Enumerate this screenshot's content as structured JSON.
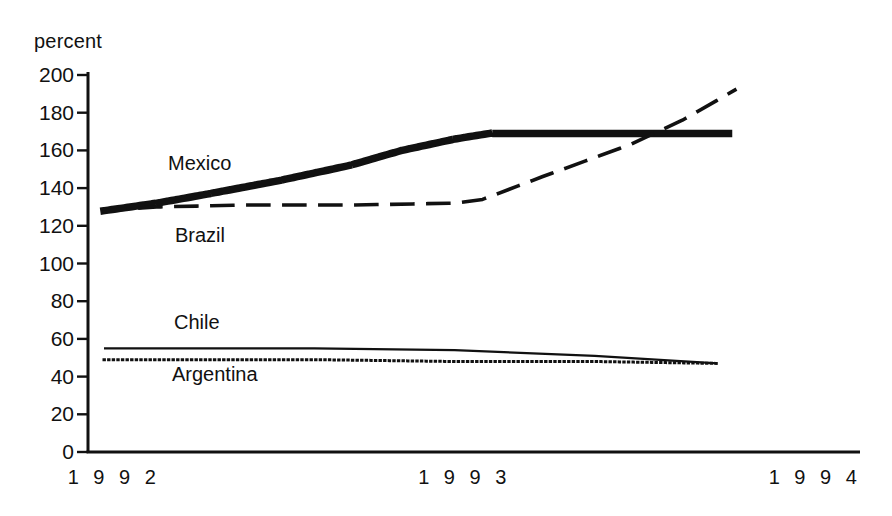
{
  "chart_data": {
    "type": "line",
    "title": "",
    "xlabel": "",
    "ylabel": "percent",
    "ylim": [
      0,
      200
    ],
    "xlim": [
      1992,
      1994
    ],
    "grid": false,
    "legend_position": "inline-labels",
    "ytick_labels": [
      "200",
      "180",
      "160",
      "140",
      "120",
      "100",
      "80",
      "60",
      "40",
      "20",
      "0"
    ],
    "ytick_values": [
      200,
      180,
      160,
      140,
      120,
      100,
      80,
      60,
      40,
      20,
      0
    ],
    "xtick_labels": [
      "1 9 9 2",
      "1 9 9 3",
      "1 9 9 4"
    ],
    "xtick_values": [
      1992,
      1993,
      1994
    ],
    "series": [
      {
        "name": "Mexico",
        "style": "thick-dotted",
        "x": [
          1992.0,
          1992.15,
          1992.3,
          1992.5,
          1992.7,
          1992.85,
          1993.0,
          1993.1,
          1993.2,
          1993.5,
          1993.8
        ],
        "values": [
          128,
          132,
          137,
          144,
          152,
          160,
          166,
          169,
          169,
          169,
          169
        ]
      },
      {
        "name": "Brazil",
        "style": "dashed",
        "x": [
          1992.0,
          1992.15,
          1992.4,
          1992.7,
          1993.0,
          1993.08,
          1993.25,
          1993.5,
          1993.65,
          1993.8
        ],
        "values": [
          128,
          130,
          131,
          131,
          132,
          134,
          146,
          163,
          176,
          192
        ]
      },
      {
        "name": "Chile",
        "style": "solid",
        "x": [
          1992.0,
          1992.6,
          1993.0,
          1993.4,
          1993.75
        ],
        "values": [
          55,
          55,
          54,
          51,
          47
        ]
      },
      {
        "name": "Argentina",
        "style": "fine-dotted",
        "x": [
          1992.0,
          1992.6,
          1993.0,
          1993.4,
          1993.75
        ],
        "values": [
          49,
          49,
          48,
          48,
          47
        ]
      }
    ],
    "annotations": [
      {
        "text": "Mexico",
        "x_px": 168,
        "y_px": 152
      },
      {
        "text": "Brazil",
        "x_px": 175,
        "y_px": 224
      },
      {
        "text": "Chile",
        "x_px": 174,
        "y_px": 311
      },
      {
        "text": "Argentina",
        "x_px": 172,
        "y_px": 363
      }
    ]
  },
  "axis": {
    "unit_label": "percent"
  },
  "colors": {
    "ink": "#111111",
    "background": "#ffffff"
  }
}
